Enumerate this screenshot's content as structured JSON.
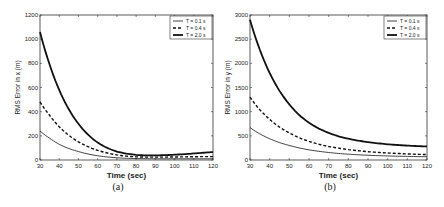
{
  "chart_data": [
    {
      "type": "line",
      "panel": "(a)",
      "title": "",
      "xlabel": "Time (sec)",
      "ylabel": "RMS Error in x (m)",
      "xlim": [
        30,
        120
      ],
      "ylim": [
        0,
        1200
      ],
      "xticks": [
        30,
        40,
        50,
        60,
        70,
        80,
        90,
        100,
        110,
        120
      ],
      "yticks": [
        0,
        200,
        400,
        600,
        800,
        1000,
        1200
      ],
      "grid": false,
      "legend_position": "upper right",
      "x": [
        30,
        35,
        40,
        45,
        50,
        55,
        60,
        65,
        70,
        75,
        80,
        85,
        90,
        95,
        100,
        105,
        110,
        115,
        120
      ],
      "series": [
        {
          "name": "T = 0.1 s",
          "style": "thin-solid",
          "values": [
            240,
            180,
            130,
            95,
            70,
            50,
            35,
            25,
            18,
            14,
            12,
            11,
            10,
            10,
            10,
            10,
            10,
            10,
            10
          ]
        },
        {
          "name": "T = 0.4 s",
          "style": "dashed",
          "values": [
            480,
            370,
            275,
            205,
            150,
            110,
            80,
            58,
            42,
            32,
            26,
            24,
            24,
            24,
            25,
            26,
            27,
            28,
            28
          ]
        },
        {
          "name": "T = 2.0 s",
          "style": "thick-solid",
          "values": [
            1060,
            790,
            580,
            420,
            300,
            210,
            145,
            100,
            70,
            52,
            42,
            38,
            38,
            40,
            44,
            48,
            54,
            60,
            66
          ]
        }
      ]
    },
    {
      "type": "line",
      "panel": "(b)",
      "title": "",
      "xlabel": "Time (sec)",
      "ylabel": "RMS Error in y (m)",
      "xlim": [
        30,
        120
      ],
      "ylim": [
        0,
        3000
      ],
      "xticks": [
        30,
        40,
        50,
        60,
        70,
        80,
        90,
        100,
        110,
        120
      ],
      "yticks": [
        0,
        500,
        1000,
        1500,
        2000,
        2500,
        3000
      ],
      "grid": false,
      "legend_position": "upper right",
      "x": [
        30,
        35,
        40,
        45,
        50,
        55,
        60,
        65,
        70,
        75,
        80,
        85,
        90,
        95,
        100,
        105,
        110,
        115,
        120
      ],
      "series": [
        {
          "name": "T = 0.1 s",
          "style": "thin-solid",
          "values": [
            670,
            540,
            440,
            360,
            300,
            250,
            210,
            180,
            155,
            135,
            120,
            108,
            98,
            90,
            84,
            78,
            74,
            70,
            67
          ]
        },
        {
          "name": "T = 0.4 s",
          "style": "dashed",
          "values": [
            1300,
            1040,
            840,
            680,
            560,
            460,
            385,
            325,
            280,
            245,
            215,
            192,
            172,
            157,
            145,
            135,
            126,
            118,
            112
          ]
        },
        {
          "name": "T = 2.0 s",
          "style": "thick-solid",
          "values": [
            2900,
            2280,
            1800,
            1430,
            1150,
            930,
            770,
            650,
            560,
            490,
            440,
            400,
            370,
            345,
            325,
            310,
            298,
            288,
            280
          ]
        }
      ]
    }
  ],
  "captions": {
    "a": "(a)",
    "b": "(b)"
  }
}
